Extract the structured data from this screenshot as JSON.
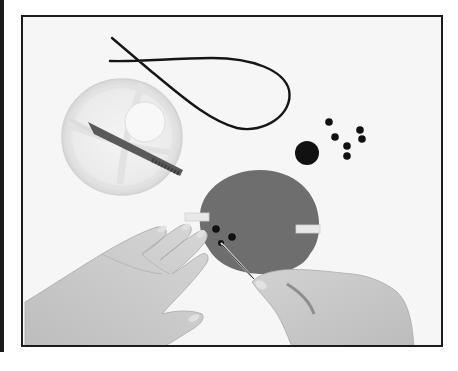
{
  "image": {
    "description": "Grayscale photograph of hands punching holes into a foam disc with a craft tool; nearby a clear plastic dish with a punch tool, a black cord loop, and small black foam dots",
    "frame": {
      "border_color": "#1c1c1c",
      "background": "#f6f6f6"
    },
    "colors": {
      "foam_disc": "#6e6e6e",
      "dots": "#111111",
      "cord": "#151515",
      "skin": "#c9c9c9",
      "tape": "#e6e6e6",
      "dish": "#ececec",
      "tool_handle": "#5a5a5a"
    },
    "objects": [
      {
        "name": "black-cord-loop"
      },
      {
        "name": "plastic-dish"
      },
      {
        "name": "punch-tool"
      },
      {
        "name": "large-black-dot"
      },
      {
        "name": "small-black-dots",
        "count": 6
      },
      {
        "name": "foam-disc",
        "holes": 3
      },
      {
        "name": "tape-strips",
        "count": 2
      },
      {
        "name": "left-hand"
      },
      {
        "name": "right-hand-holding-pin"
      }
    ]
  }
}
